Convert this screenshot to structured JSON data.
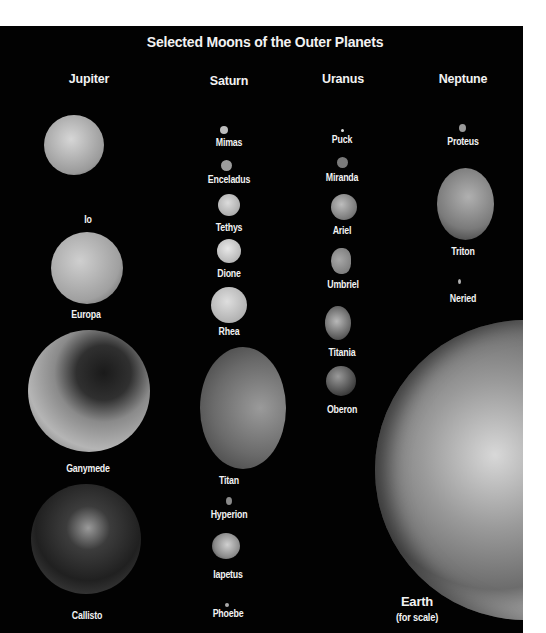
{
  "title": "Selected Moons of the Outer Planets",
  "planets": [
    {
      "name": "Jupiter",
      "moons": [
        {
          "name": "Io",
          "x": 74,
          "y": 150,
          "d": 60,
          "tone": "#b9b9b9"
        },
        {
          "name": "Europa",
          "x": 86,
          "y": 267,
          "d": 70,
          "tone": "#a8a8a8"
        },
        {
          "name": "Ganymede",
          "x": 88,
          "y": 390,
          "d": 120,
          "tone": "#8a8a8a"
        },
        {
          "name": "Callisto",
          "x": 85,
          "y": 542,
          "d": 110,
          "tone": "#3a3a3a"
        }
      ]
    },
    {
      "name": "Saturn",
      "moons": [
        {
          "name": "Mimas",
          "x": 224,
          "y": 130,
          "d": 8,
          "tone": "#bdbdbd"
        },
        {
          "name": "Enceladus",
          "x": 226,
          "y": 166,
          "d": 11,
          "tone": "#9c9c9c"
        },
        {
          "name": "Tethys",
          "x": 228,
          "y": 206,
          "d": 22,
          "tone": "#c8c8c8"
        },
        {
          "name": "Dione",
          "x": 229,
          "y": 251,
          "d": 24,
          "tone": "#d2d2d2"
        },
        {
          "name": "Rhea",
          "x": 229,
          "y": 305,
          "d": 36,
          "tone": "#c6c6c6"
        },
        {
          "name": "Titan",
          "x": 243,
          "y": 408,
          "d": 116,
          "tone": "#6e6e6e"
        },
        {
          "name": "Hyperion",
          "x": 229,
          "y": 501,
          "d": 6,
          "tone": "#8a8a8a"
        },
        {
          "name": "Iapetus",
          "x": 227,
          "y": 545,
          "d": 28,
          "tone": "#bcbcbc"
        },
        {
          "name": "Phoebe",
          "x": 226,
          "y": 605,
          "d": 4,
          "tone": "#aaaaaa"
        }
      ]
    },
    {
      "name": "Uranus",
      "moons": [
        {
          "name": "Puck",
          "x": 343,
          "y": 130,
          "d": 3,
          "tone": "#e0e0e0"
        },
        {
          "name": "Miranda",
          "x": 343,
          "y": 163,
          "d": 11,
          "tone": "#7a7a7a"
        },
        {
          "name": "Ariel",
          "x": 343,
          "y": 208,
          "d": 26,
          "tone": "#a8a8a8"
        },
        {
          "name": "Umbriel",
          "x": 340,
          "y": 262,
          "d": 24,
          "tone": "#8e8e8e"
        },
        {
          "name": "Titania",
          "x": 339,
          "y": 323,
          "d": 30,
          "tone": "#a5a5a5"
        },
        {
          "name": "Oberon",
          "x": 338,
          "y": 382,
          "d": 28,
          "tone": "#7d7d7d"
        }
      ]
    },
    {
      "name": "Neptune",
      "moons": [
        {
          "name": "Proteus",
          "x": 462,
          "y": 128,
          "d": 7,
          "tone": "#9a9a9a"
        },
        {
          "name": "Triton",
          "x": 464,
          "y": 205,
          "d": 70,
          "tone": "#8c8c8c"
        },
        {
          "name": "Neried",
          "x": 459,
          "y": 283,
          "d": 3,
          "tone": "#b0b0b0"
        }
      ]
    }
  ],
  "earth": {
    "label": "Earth",
    "sublabel": "(for scale)"
  }
}
